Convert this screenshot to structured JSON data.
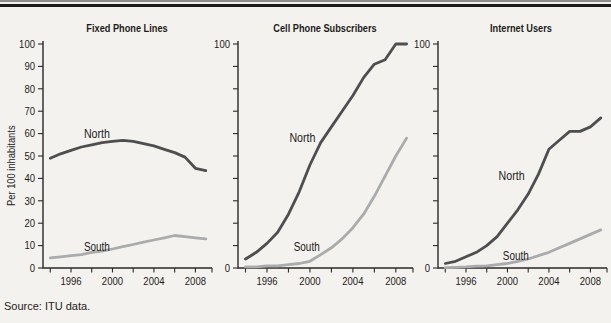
{
  "page": {
    "source_note": "Source: ITU data.",
    "colors": {
      "north": "#4d4e50",
      "south": "#a9abad",
      "axis": "#2b2a28",
      "text": "#1d1c1a",
      "background": "#f4f2ee",
      "rule_thin": "#8d8d8d",
      "rule_thick": "#1b1b19"
    }
  },
  "chart_data": [
    {
      "type": "line",
      "title": "Fixed Phone Lines",
      "ylabel": "Per 100 inhabitants",
      "xlabel": "",
      "ylim": [
        0,
        100
      ],
      "ytick_step": 10,
      "ytick_labels": [
        0,
        10,
        20,
        30,
        40,
        50,
        60,
        70,
        80,
        90,
        100
      ],
      "xlim": [
        1993.3,
        2009.6
      ],
      "xticks": [
        1994,
        1996,
        1998,
        2000,
        2002,
        2004,
        2006,
        2008
      ],
      "xtick_labels": [
        {
          "year": 1996,
          "label": "1996"
        },
        {
          "year": 2000,
          "label": "2000"
        },
        {
          "year": 2004,
          "label": "2004"
        },
        {
          "year": 2008,
          "label": "2008"
        }
      ],
      "grid": false,
      "legend": "inline-labels",
      "x": [
        1994,
        1995,
        1996,
        1997,
        1998,
        1999,
        2000,
        2001,
        2002,
        2003,
        2004,
        2005,
        2006,
        2007,
        2008,
        2009
      ],
      "series": [
        {
          "name": "North",
          "color": "#4d4e50",
          "values": [
            49,
            51,
            52.5,
            54,
            55,
            56,
            56.5,
            57,
            56.5,
            55.5,
            54.5,
            53,
            51.5,
            49.5,
            44.5,
            43.5
          ],
          "label_at": [
            1998.5,
            60
          ]
        },
        {
          "name": "South",
          "color": "#a9abad",
          "values": [
            4.5,
            5,
            5.5,
            6,
            7,
            7.5,
            8.5,
            9.5,
            10.5,
            11.5,
            12.5,
            13.5,
            14.5,
            14,
            13.5,
            13
          ],
          "label_at": [
            1998.5,
            9.5
          ]
        }
      ]
    },
    {
      "type": "line",
      "title": "Cell Phone Subscribers",
      "ylabel": "",
      "xlabel": "",
      "ylim": [
        0,
        100
      ],
      "ytick_step": 10,
      "ytick_labels": [
        0,
        100
      ],
      "xlim": [
        1993.3,
        2009.6
      ],
      "xticks": [
        1994,
        1996,
        1998,
        2000,
        2002,
        2004,
        2006,
        2008
      ],
      "xtick_labels": [
        {
          "year": 1996,
          "label": "1996"
        },
        {
          "year": 2000,
          "label": "2000"
        },
        {
          "year": 2004,
          "label": "2004"
        },
        {
          "year": 2008,
          "label": "2008"
        }
      ],
      "grid": false,
      "legend": "inline-labels",
      "x": [
        1994,
        1995,
        1996,
        1997,
        1998,
        1999,
        2000,
        2001,
        2002,
        2003,
        2004,
        2005,
        2006,
        2007,
        2008,
        2009
      ],
      "series": [
        {
          "name": "North",
          "color": "#4d4e50",
          "values": [
            4,
            7,
            11,
            16,
            24,
            34,
            46,
            56,
            63,
            70,
            77,
            85,
            91,
            93,
            100,
            100
          ],
          "label_at": [
            1999.3,
            58
          ]
        },
        {
          "name": "South",
          "color": "#a9abad",
          "values": [
            0.5,
            0.5,
            1,
            1,
            1.5,
            2,
            3,
            6,
            9,
            13,
            18,
            24,
            32,
            41,
            50,
            58
          ],
          "label_at": [
            1999.7,
            9.5
          ]
        }
      ]
    },
    {
      "type": "line",
      "title": "Internet Users",
      "ylabel": "",
      "xlabel": "",
      "ylim": [
        0,
        100
      ],
      "ytick_step": 10,
      "ytick_labels": [
        0,
        100
      ],
      "xlim": [
        1993.3,
        2009.6
      ],
      "xticks": [
        1994,
        1996,
        1998,
        2000,
        2002,
        2004,
        2006,
        2008
      ],
      "xtick_labels": [
        {
          "year": 1996,
          "label": "1996"
        },
        {
          "year": 2000,
          "label": "2000"
        },
        {
          "year": 2004,
          "label": "2004"
        },
        {
          "year": 2008,
          "label": "2008"
        }
      ],
      "grid": false,
      "legend": "inline-labels",
      "x": [
        1994,
        1995,
        1996,
        1997,
        1998,
        1999,
        2000,
        2001,
        2002,
        2003,
        2004,
        2005,
        2006,
        2007,
        2008,
        2009
      ],
      "series": [
        {
          "name": "North",
          "color": "#4d4e50",
          "values": [
            2,
            3,
            5,
            7,
            10,
            14,
            20,
            26,
            33,
            42,
            53,
            57,
            61,
            61,
            63,
            67
          ],
          "label_at": [
            2000.4,
            41
          ]
        },
        {
          "name": "South",
          "color": "#a9abad",
          "values": [
            0.2,
            0.3,
            0.5,
            0.8,
            1,
            1.5,
            2,
            3,
            4,
            5.5,
            7,
            9,
            11,
            13,
            15,
            17
          ],
          "label_at": [
            2000.8,
            5.5
          ]
        }
      ]
    }
  ]
}
